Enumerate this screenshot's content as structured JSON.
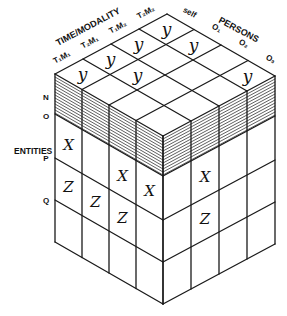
{
  "diagram": {
    "type": "isometric-data-cube",
    "axes": {
      "time_modality": {
        "title": "TIME/MODALITY",
        "levels": [
          "T₁M₁",
          "T₂M₁",
          "T₁M₂",
          "T₂M₂"
        ]
      },
      "persons": {
        "title": "PERSONS",
        "levels": [
          "self",
          "O₁",
          "O₂",
          "O₃"
        ]
      },
      "entities": {
        "title": "ENTITIES",
        "levels": [
          "N",
          "O",
          "P",
          "Q"
        ]
      }
    },
    "hatched_layer": "N",
    "top_face_marks": [
      {
        "time": 0,
        "person": 0,
        "mark": "y"
      },
      {
        "time": 1,
        "person": 0,
        "mark": "y"
      },
      {
        "time": 2,
        "person": 0,
        "mark": "y"
      },
      {
        "time": 3,
        "person": 0,
        "mark": "y"
      },
      {
        "time": 1,
        "person": 1,
        "mark": "y"
      },
      {
        "time": 3,
        "person": 1,
        "mark": "y"
      },
      {
        "time": 3,
        "person": 3,
        "mark": "y"
      }
    ],
    "left_face_marks": [
      {
        "person": 0,
        "entity": 1,
        "mark": "X"
      },
      {
        "person": 0,
        "entity": 2,
        "mark": "Z"
      },
      {
        "person": 1,
        "entity": 2,
        "mark": "Z"
      },
      {
        "person": 2,
        "entity": 1,
        "mark": "X"
      },
      {
        "person": 2,
        "entity": 2,
        "mark": "Z"
      },
      {
        "person": 3,
        "entity": 1,
        "mark": "X"
      }
    ],
    "right_face_marks": [
      {
        "time": 1,
        "entity": 1,
        "mark": "X"
      },
      {
        "time": 1,
        "entity": 2,
        "mark": "Z"
      }
    ],
    "colors": {
      "line": "#1a1a1a",
      "hatch": "#2a2a2a",
      "background": "#ffffff"
    }
  }
}
